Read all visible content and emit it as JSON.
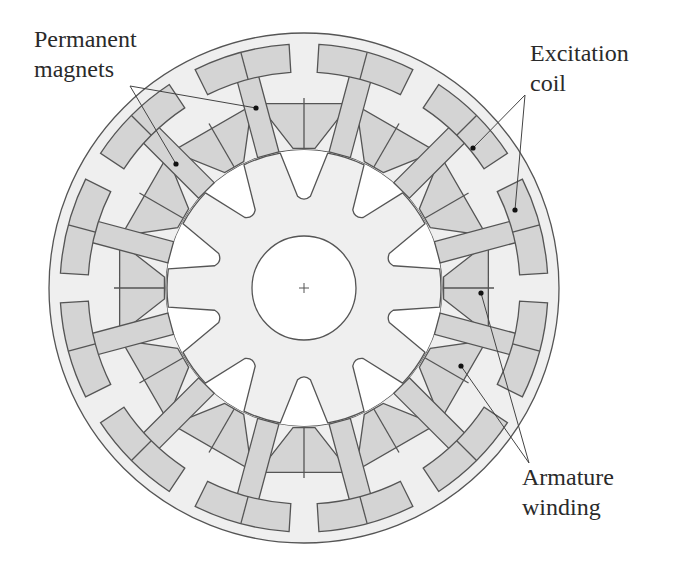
{
  "diagram": {
    "title": "",
    "colors": {
      "background": "#ffffff",
      "stator_fill": "#efefef",
      "component_fill": "#d4d4d4",
      "rotor_fill": "#efefef",
      "air_gap": "#ffffff",
      "outline": "#555555",
      "leader": "#444444"
    },
    "geometry": {
      "center": [
        304,
        288
      ],
      "outer_radius": 255,
      "bore_radius": 138,
      "shaft_radius": 52,
      "rotor_teeth": 10,
      "stator_modules": 12
    },
    "labels": {
      "permanent_magnets": {
        "line1": "Permanent",
        "line2": "magnets"
      },
      "excitation_coil": {
        "line1": "Excitation",
        "line2": "coil"
      },
      "armature_winding": {
        "line1": "Armature",
        "line2": "winding"
      }
    },
    "components": [
      {
        "name": "Stator",
        "count": 1
      },
      {
        "name": "Rotor",
        "teeth": 10
      },
      {
        "name": "Permanent magnets",
        "count": 12
      },
      {
        "name": "Excitation coil",
        "count": 12
      },
      {
        "name": "Armature winding",
        "count": 12
      },
      {
        "name": "Shaft",
        "marker": "+"
      }
    ]
  }
}
